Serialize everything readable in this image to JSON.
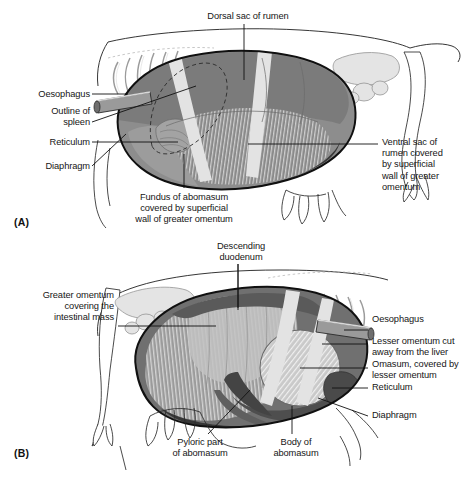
{
  "figure": {
    "type": "anatomical-illustration",
    "style": "grayscale line drawing with tonal shading",
    "panels": [
      {
        "tag": "(A)",
        "view": "left lateral view of the bovine abdomen",
        "labels": [
          {
            "name": "dorsal-sac-of-rumen",
            "text": "Dorsal sac of rumen",
            "align": "center",
            "x": 188,
            "y": 11,
            "width": 120
          },
          {
            "name": "oesophagus",
            "text": "Oesophagus",
            "align": "right",
            "x": 12,
            "y": 89,
            "width": 78
          },
          {
            "name": "outline-of-spleen",
            "text": "Outline of\nspleen",
            "align": "right",
            "x": 12,
            "y": 106,
            "width": 78
          },
          {
            "name": "reticulum",
            "text": "Reticulum",
            "align": "right",
            "x": 12,
            "y": 137,
            "width": 78
          },
          {
            "name": "diaphragm",
            "text": "Diaphragm",
            "align": "right",
            "x": 12,
            "y": 161,
            "width": 78
          },
          {
            "name": "ventral-sac-of-rumen",
            "text": "Ventral sac of\nrumen covered\nby superficial\nwall of greater\nomentum",
            "align": "left",
            "x": 382,
            "y": 137,
            "width": 88
          },
          {
            "name": "fundus-of-abomasum",
            "text": "Fundus of abomasum\ncovered by superficial\nwall of greater omentum",
            "align": "center",
            "x": 104,
            "y": 192,
            "width": 160
          }
        ]
      },
      {
        "tag": "(B)",
        "view": "right lateral view of the bovine abdomen",
        "labels": [
          {
            "name": "descending-duodenum",
            "text": "Descending\nduodenum",
            "align": "center",
            "x": 186,
            "y": 241,
            "width": 110
          },
          {
            "name": "greater-omentum",
            "text": "Greater omentum\ncovering the\nintestinal mass",
            "align": "right",
            "x": 10,
            "y": 290,
            "width": 104
          },
          {
            "name": "oesophagus",
            "text": "Oesophagus",
            "align": "left",
            "x": 372,
            "y": 314,
            "width": 96
          },
          {
            "name": "lesser-omentum",
            "text": "Lesser omentum cut\naway from the liver",
            "align": "left",
            "x": 372,
            "y": 336,
            "width": 100
          },
          {
            "name": "omasum",
            "text": "Omasum, covered by\nlesser omentum",
            "align": "left",
            "x": 372,
            "y": 359,
            "width": 100
          },
          {
            "name": "reticulum",
            "text": "Reticulum",
            "align": "left",
            "x": 372,
            "y": 382,
            "width": 96
          },
          {
            "name": "diaphragm",
            "text": "Diaphragm",
            "align": "left",
            "x": 372,
            "y": 410,
            "width": 96
          },
          {
            "name": "pyloric-part-of-abomasum",
            "text": "Pyloric part\nof abomasum",
            "align": "center",
            "x": 160,
            "y": 437,
            "width": 80
          },
          {
            "name": "body-of-abomasum",
            "text": "Body of\nabomasum",
            "align": "center",
            "x": 258,
            "y": 437,
            "width": 76
          }
        ]
      }
    ],
    "colors": {
      "background": "#ffffff",
      "ink": "#1a1a1a",
      "rumen_mid_gray": "#8d8d8d",
      "rumen_dark_gray": "#6f6f6f",
      "viscera_dark": "#595959",
      "omentum_light": "#d9d9d9",
      "skeleton_light": "#e2e2e2",
      "outline_black": "#141414"
    }
  }
}
